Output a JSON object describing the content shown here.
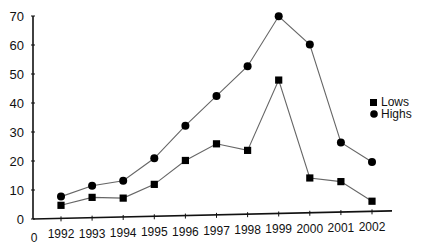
{
  "chart_data": {
    "type": "line",
    "title": "",
    "xlabel": "",
    "ylabel": "",
    "categories": [
      "1992",
      "1993",
      "1994",
      "1995",
      "1996",
      "1997",
      "1998",
      "1999",
      "2000",
      "2001",
      "2002"
    ],
    "x_origin_label": "0",
    "series": [
      {
        "name": "Lows",
        "marker": "square",
        "values": [
          4.5,
          7,
          6.5,
          11,
          19,
          24.5,
          22,
          46,
          12,
          10.5,
          3.5
        ]
      },
      {
        "name": "Highs",
        "marker": "circle",
        "values": [
          7.5,
          11,
          12.5,
          20,
          31,
          41,
          51,
          68,
          58,
          24,
          17
        ]
      }
    ],
    "ylim": [
      0,
      70
    ],
    "yticks": [
      0,
      10,
      20,
      30,
      40,
      50,
      60,
      70
    ],
    "grid": false,
    "legend_position": "right",
    "colors": {
      "line": "#666666",
      "marker": "#000000",
      "axis": "#111111",
      "text": "#111111"
    }
  },
  "legend": {
    "items": [
      {
        "label": "Lows",
        "marker": "square"
      },
      {
        "label": "Highs",
        "marker": "circle"
      }
    ]
  }
}
